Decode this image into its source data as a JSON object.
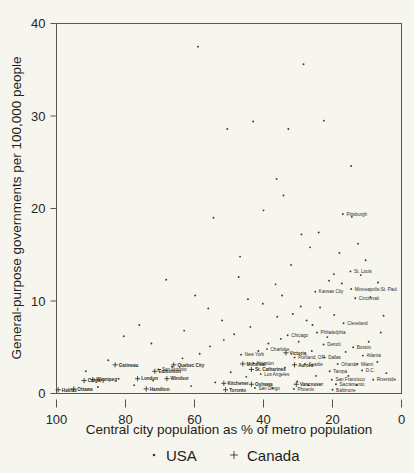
{
  "chart_data": {
    "type": "scatter",
    "title": "",
    "xlabel": "Central city population as % of metro population",
    "ylabel": "General-purpose governments per 100,000 people",
    "xlim": [
      100,
      0
    ],
    "ylim": [
      0,
      40
    ],
    "x_reversed": true,
    "grid": false,
    "xticks": [
      100,
      80,
      60,
      40,
      20,
      0
    ],
    "yticks": [
      0,
      10,
      20,
      30,
      40
    ],
    "legend": {
      "position": "bottom",
      "entries": [
        {
          "name": "USA",
          "marker": "dot"
        },
        {
          "name": "Canada",
          "marker": "plus"
        }
      ]
    },
    "series": [
      {
        "name": "USA",
        "marker": "dot",
        "points": [
          {
            "label": "",
            "x": 59.0,
            "y": 37.5
          },
          {
            "label": "",
            "x": 28.4,
            "y": 35.6
          },
          {
            "label": "",
            "x": 22.5,
            "y": 29.5
          },
          {
            "label": "",
            "x": 50.5,
            "y": 28.6
          },
          {
            "label": "",
            "x": 43.0,
            "y": 29.4
          },
          {
            "label": "",
            "x": 32.8,
            "y": 28.6
          },
          {
            "label": "",
            "x": 14.6,
            "y": 24.6
          },
          {
            "label": "",
            "x": 36.2,
            "y": 23.2
          },
          {
            "label": "",
            "x": 34.2,
            "y": 21.4
          },
          {
            "label": "Pittsburgh",
            "x": 17.0,
            "y": 19.4
          },
          {
            "label": "",
            "x": 14.4,
            "y": 19.1
          },
          {
            "label": "",
            "x": 24.0,
            "y": 17.4
          },
          {
            "label": "",
            "x": 12.6,
            "y": 16.2
          },
          {
            "label": "",
            "x": 10.4,
            "y": 14.4
          },
          {
            "label": "St. Louis",
            "x": 14.8,
            "y": 13.2
          },
          {
            "label": "",
            "x": 19.6,
            "y": 12.9
          },
          {
            "label": "",
            "x": 17.3,
            "y": 11.9
          },
          {
            "label": "Minneapolis-St. Paul",
            "x": 14.6,
            "y": 11.3
          },
          {
            "label": "Kansas City",
            "x": 25.0,
            "y": 11.0
          },
          {
            "label": "Cincinnati",
            "x": 13.4,
            "y": 10.3
          },
          {
            "label": "",
            "x": 59.8,
            "y": 10.6
          },
          {
            "label": "",
            "x": 46.8,
            "y": 14.8
          },
          {
            "label": "",
            "x": 47.2,
            "y": 12.6
          },
          {
            "label": "",
            "x": 68.2,
            "y": 12.3
          },
          {
            "label": "",
            "x": 32.0,
            "y": 13.9
          },
          {
            "label": "",
            "x": 36.5,
            "y": 11.8
          },
          {
            "label": "",
            "x": 40.2,
            "y": 9.7
          },
          {
            "label": "",
            "x": 29.2,
            "y": 9.4
          },
          {
            "label": "",
            "x": 23.6,
            "y": 9.3
          },
          {
            "label": "Cleveland",
            "x": 16.8,
            "y": 7.6
          },
          {
            "label": "Philadelphia",
            "x": 24.5,
            "y": 6.6
          },
          {
            "label": "Chicago",
            "x": 33.0,
            "y": 6.3
          },
          {
            "label": "Detroit",
            "x": 22.6,
            "y": 5.3
          },
          {
            "label": "Boston",
            "x": 14.0,
            "y": 5.0
          },
          {
            "label": "Charlotte",
            "x": 39.0,
            "y": 4.8
          },
          {
            "label": "New York",
            "x": 46.5,
            "y": 4.2
          },
          {
            "label": "Portland, OR",
            "x": 31.0,
            "y": 3.9
          },
          {
            "label": "Dallas",
            "x": 22.3,
            "y": 3.9
          },
          {
            "label": "Atlanta",
            "x": 11.2,
            "y": 4.1
          },
          {
            "label": "Houston",
            "x": 43.0,
            "y": 3.3
          },
          {
            "label": "Seattle",
            "x": 28.0,
            "y": 3.2
          },
          {
            "label": "Orlando",
            "x": 18.5,
            "y": 3.2
          },
          {
            "label": "Miami",
            "x": 12.8,
            "y": 3.2
          },
          {
            "label": "Tampa",
            "x": 20.8,
            "y": 2.4
          },
          {
            "label": "D.C.",
            "x": 11.4,
            "y": 2.5
          },
          {
            "label": "Los Angeles",
            "x": 40.8,
            "y": 2.1
          },
          {
            "label": "San Francisco",
            "x": 20.2,
            "y": 1.5
          },
          {
            "label": "Riverside",
            "x": 8.2,
            "y": 1.5
          },
          {
            "label": "Sacramento",
            "x": 19.0,
            "y": 1.0
          },
          {
            "label": "Baltimore",
            "x": 20.0,
            "y": 0.4
          },
          {
            "label": "Phoenix",
            "x": 31.2,
            "y": 0.5
          },
          {
            "label": "San Diego",
            "x": 42.5,
            "y": 0.6
          },
          {
            "label": "San Antonio",
            "x": 70.5,
            "y": 2.6
          },
          {
            "label": "",
            "x": 36.0,
            "y": 8.3
          },
          {
            "label": "",
            "x": 31.5,
            "y": 8.6
          },
          {
            "label": "",
            "x": 27.5,
            "y": 7.9
          },
          {
            "label": "",
            "x": 19.5,
            "y": 8.5
          },
          {
            "label": "",
            "x": 25.8,
            "y": 7.4
          },
          {
            "label": "",
            "x": 43.8,
            "y": 7.2
          },
          {
            "label": "",
            "x": 48.5,
            "y": 6.4
          },
          {
            "label": "",
            "x": 51.5,
            "y": 5.8
          },
          {
            "label": "",
            "x": 55.5,
            "y": 5.1
          },
          {
            "label": "",
            "x": 58.5,
            "y": 4.3
          },
          {
            "label": "",
            "x": 63.5,
            "y": 3.8
          },
          {
            "label": "",
            "x": 66.5,
            "y": 2.9
          },
          {
            "label": "",
            "x": 72.0,
            "y": 1.4
          },
          {
            "label": "",
            "x": 77.5,
            "y": 0.9
          },
          {
            "label": "",
            "x": 82.0,
            "y": 1.6
          },
          {
            "label": "",
            "x": 88.0,
            "y": 0.7
          },
          {
            "label": "",
            "x": 35.0,
            "y": 5.9
          },
          {
            "label": "",
            "x": 38.6,
            "y": 5.4
          },
          {
            "label": "",
            "x": 29.8,
            "y": 5.6
          },
          {
            "label": "",
            "x": 26.0,
            "y": 4.6
          },
          {
            "label": "",
            "x": 16.2,
            "y": 4.5
          },
          {
            "label": "",
            "x": 9.5,
            "y": 5.6
          },
          {
            "label": "",
            "x": 7.0,
            "y": 3.4
          },
          {
            "label": "",
            "x": 6.0,
            "y": 6.6
          },
          {
            "label": "",
            "x": 5.2,
            "y": 8.4
          },
          {
            "label": "",
            "x": 4.4,
            "y": 2.2
          },
          {
            "label": "",
            "x": 33.8,
            "y": 2.8
          },
          {
            "label": "",
            "x": 45.0,
            "y": 1.8
          },
          {
            "label": "",
            "x": 49.5,
            "y": 2.3
          },
          {
            "label": "",
            "x": 54.0,
            "y": 1.2
          },
          {
            "label": "",
            "x": 61.0,
            "y": 0.8
          },
          {
            "label": "",
            "x": 24.8,
            "y": 1.9
          },
          {
            "label": "",
            "x": 15.4,
            "y": 1.9
          },
          {
            "label": "",
            "x": 13.0,
            "y": 0.9
          },
          {
            "label": "",
            "x": 27.0,
            "y": 0.9
          },
          {
            "label": "",
            "x": 37.4,
            "y": 0.6
          },
          {
            "label": "",
            "x": 30.2,
            "y": 1.3
          },
          {
            "label": "",
            "x": 21.5,
            "y": 6.1
          },
          {
            "label": "",
            "x": 41.5,
            "y": 4.6
          },
          {
            "label": "",
            "x": 34.6,
            "y": 10.6
          },
          {
            "label": "",
            "x": 44.5,
            "y": 10.2
          },
          {
            "label": "",
            "x": 56.0,
            "y": 9.2
          },
          {
            "label": "",
            "x": 52.0,
            "y": 7.9
          },
          {
            "label": "",
            "x": 63.0,
            "y": 6.8
          },
          {
            "label": "",
            "x": 72.5,
            "y": 5.4
          },
          {
            "label": "",
            "x": 85.0,
            "y": 3.6
          },
          {
            "label": "",
            "x": 91.5,
            "y": 2.4
          },
          {
            "label": "",
            "x": 18.0,
            "y": 15.2
          },
          {
            "label": "",
            "x": 26.5,
            "y": 15.8
          },
          {
            "label": "",
            "x": 21.0,
            "y": 12.2
          },
          {
            "label": "",
            "x": 11.8,
            "y": 12.8
          },
          {
            "label": "",
            "x": 9.0,
            "y": 10.4
          },
          {
            "label": "",
            "x": 29.0,
            "y": 17.2
          },
          {
            "label": "",
            "x": 40.0,
            "y": 19.8
          },
          {
            "label": "",
            "x": 54.5,
            "y": 19.0
          },
          {
            "label": "",
            "x": 76.0,
            "y": 7.4
          },
          {
            "label": "",
            "x": 80.5,
            "y": 6.2
          },
          {
            "label": "",
            "x": 6.8,
            "y": 12.0
          }
        ]
      },
      {
        "name": "Canada",
        "marker": "plus",
        "points": [
          {
            "label": "Halifax",
            "x": 99.5,
            "y": 0.4
          },
          {
            "label": "Ottawa",
            "x": 95.0,
            "y": 0.5
          },
          {
            "label": "Calgary",
            "x": 92.0,
            "y": 1.4
          },
          {
            "label": "Winnipeg",
            "x": 89.5,
            "y": 1.5
          },
          {
            "label": "Gatineau",
            "x": 83.0,
            "y": 3.1
          },
          {
            "label": "Quebec City",
            "x": 66.0,
            "y": 3.1
          },
          {
            "label": "Edmonton",
            "x": 71.5,
            "y": 2.4
          },
          {
            "label": "London",
            "x": 76.5,
            "y": 1.6
          },
          {
            "label": "Windsor",
            "x": 68.0,
            "y": 1.6
          },
          {
            "label": "Hamilton",
            "x": 74.0,
            "y": 0.5
          },
          {
            "label": "Kitchener",
            "x": 51.5,
            "y": 1.1
          },
          {
            "label": "Toronto",
            "x": 51.0,
            "y": 0.4
          },
          {
            "label": "Montreal",
            "x": 46.0,
            "y": 3.2
          },
          {
            "label": "St. Catharines",
            "x": 43.5,
            "y": 2.6
          },
          {
            "label": "Oshawa",
            "x": 43.5,
            "y": 1.0
          },
          {
            "label": "Victoria",
            "x": 33.5,
            "y": 4.4
          },
          {
            "label": "Aurora",
            "x": 31.0,
            "y": 3.1
          },
          {
            "label": "Vancouver",
            "x": 30.5,
            "y": 1.0
          }
        ]
      }
    ]
  },
  "axes": {
    "x_title": "Central city population as % of metro population",
    "y_title": "General-purpose governments per 100,000 people",
    "x_tick_labels": [
      "100",
      "80",
      "60",
      "40",
      "20",
      "0"
    ],
    "y_tick_labels": [
      "0",
      "10",
      "20",
      "30",
      "40"
    ]
  },
  "legend": {
    "usa_label": "USA",
    "canada_label": "Canada"
  },
  "colors": {
    "background": "#f7f6ee",
    "axis": "#56564e",
    "point": "#3a3a31",
    "text": "#1d1d18"
  }
}
